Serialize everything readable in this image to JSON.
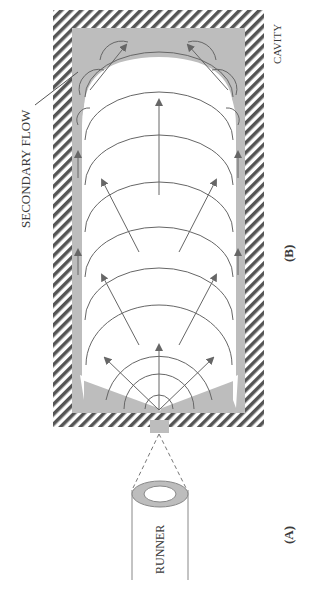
{
  "labels": {
    "secondary_flow": "SECONDARY FLOW",
    "cavity": "CAVITY",
    "panel_b": "(B)",
    "panel_a": "(A)",
    "runner": "RUNNER"
  },
  "colors": {
    "hatch": "#555555",
    "frozen_layer": "#bdbdbd",
    "flow_line": "#666666",
    "background": "#ffffff",
    "text": "#3a3a3a"
  }
}
